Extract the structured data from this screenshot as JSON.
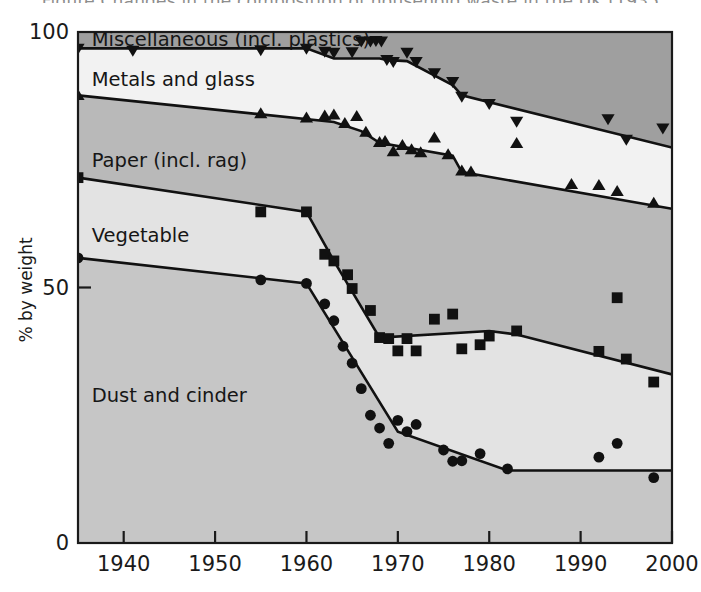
{
  "figure": {
    "clipped_caption_top": "Figure  Changes in the composition of household waste in the UK (1935",
    "background_color": "#ffffff",
    "line_color": "#111111",
    "marker_color": "#111111"
  },
  "axes": {
    "x": {
      "label": "",
      "ticks": [
        "1940",
        "1950",
        "1960",
        "1970",
        "1980",
        "1990",
        "2000"
      ],
      "tick_values": [
        1940,
        1950,
        1960,
        1970,
        1980,
        1990,
        2000
      ],
      "range": [
        1935,
        2000
      ]
    },
    "y": {
      "label": "% by weight",
      "ticks": [
        "0",
        "50",
        "100"
      ],
      "tick_values": [
        0,
        50,
        100
      ],
      "range": [
        0,
        100
      ]
    }
  },
  "bands": [
    {
      "name": "miscellaneous",
      "label": "Miscellaneous (incl. plastics)",
      "fill": "#9f9f9f",
      "label_x": 1936.5,
      "label_y": 97.3
    },
    {
      "name": "metals-and-glass",
      "label": "Metals and glass",
      "fill": "#f2f2f2",
      "label_x": 1936.5,
      "label_y": 89.5
    },
    {
      "name": "paper",
      "label": "Paper (incl. rag)",
      "fill": "#b9b9b9",
      "label_x": 1936.5,
      "label_y": 73.5
    },
    {
      "name": "vegetable",
      "label": "Vegetable",
      "fill": "#e3e3e3",
      "label_x": 1936.5,
      "label_y": 59.0
    },
    {
      "name": "dust-and-cinder",
      "label": "Dust and cinder",
      "fill": "#c6c6c6",
      "label_x": 1936.5,
      "label_y": 27.5
    }
  ],
  "chart_data": {
    "type": "line",
    "title": "",
    "xlabel": "",
    "ylabel": "% by weight",
    "xlim": [
      1935,
      2000
    ],
    "ylim": [
      0,
      100
    ],
    "grid": false,
    "legend": "inline band labels",
    "note": "Cumulative stacked boundary lines; each series is the upper boundary of a cumulative band. Scatter markers are measured survey values on each boundary.",
    "series": [
      {
        "name": "Miscellaneous (incl. plastics)",
        "marker": "triangle-down",
        "boundary_line": {
          "x": [
            1935,
            1960,
            1963,
            1968,
            1969,
            1971,
            1976,
            1977,
            2000
          ],
          "y": [
            96.8,
            96.8,
            94.8,
            94.8,
            94.5,
            94.3,
            89.6,
            87.6,
            77.4
          ]
        },
        "points": {
          "x": [
            1935,
            1941,
            1955,
            1960,
            1962,
            1963,
            1965,
            1966,
            1967,
            1967.6,
            1968.2,
            1968.8,
            1969.5,
            1971,
            1972,
            1974,
            1976,
            1977,
            1980,
            1983,
            1993,
            1995,
            1999
          ],
          "y": [
            96.8,
            96.4,
            96.5,
            96.8,
            96.2,
            96.0,
            96.1,
            98.2,
            98.2,
            98.3,
            98.2,
            94.6,
            94.2,
            96.0,
            94.2,
            92.0,
            90.3,
            87.4,
            86.0,
            82.5,
            83.0,
            79.0,
            81.2
          ]
        }
      },
      {
        "name": "Metals and glass",
        "marker": "triangle-up",
        "boundary_line": {
          "x": [
            1935,
            1963,
            1966,
            1968,
            1976,
            1977,
            2000
          ],
          "y": [
            87.6,
            82.4,
            80.6,
            78.3,
            75.8,
            72.6,
            65.4
          ]
        },
        "points": {
          "x": [
            1935,
            1955,
            1960,
            1962,
            1963,
            1964.2,
            1965.5,
            1966.5,
            1968,
            1968.6,
            1969.5,
            1970.5,
            1971.5,
            1972.5,
            1974,
            1975.5,
            1977,
            1978,
            1983,
            1989,
            1992,
            1994,
            1998
          ],
          "y": [
            87.6,
            84.0,
            83.2,
            83.6,
            83.8,
            82.1,
            83.5,
            80.4,
            78.4,
            78.6,
            76.6,
            77.8,
            77.0,
            76.4,
            79.3,
            76.0,
            72.8,
            72.6,
            78.2,
            70.2,
            70.0,
            68.8,
            66.5
          ]
        }
      },
      {
        "name": "Paper (incl. rag)",
        "marker": "square",
        "boundary_line": {
          "x": [
            1935,
            1960,
            1963,
            1968,
            1980,
            1983,
            2000
          ],
          "y": [
            71.5,
            64.8,
            55.2,
            40.2,
            41.5,
            40.8,
            33.0
          ]
        },
        "points": {
          "x": [
            1935,
            1955,
            1960,
            1962,
            1963,
            1964.5,
            1965,
            1967,
            1968,
            1969,
            1970,
            1971,
            1972,
            1974,
            1976,
            1977,
            1979,
            1980,
            1983,
            1992,
            1994,
            1995,
            1998
          ],
          "y": [
            71.5,
            64.8,
            64.8,
            56.5,
            55.2,
            52.5,
            49.8,
            45.5,
            40.2,
            40.0,
            37.6,
            40.0,
            37.6,
            43.8,
            44.8,
            38.0,
            38.8,
            40.5,
            41.5,
            37.5,
            48.0,
            36.0,
            31.5
          ]
        }
      },
      {
        "name": "Vegetable",
        "marker": "circle",
        "boundary_line": {
          "x": [
            1935,
            1960,
            1970,
            1982,
            2000
          ],
          "y": [
            55.8,
            50.8,
            21.8,
            14.2,
            14.2
          ]
        },
        "points": {
          "x": [
            1935,
            1955,
            1960,
            1962,
            1963,
            1964,
            1965,
            1966,
            1967,
            1968,
            1969,
            1970,
            1971,
            1972,
            1975,
            1976,
            1977,
            1979,
            1982,
            1992,
            1994,
            1998
          ],
          "y": [
            55.8,
            51.5,
            50.8,
            46.8,
            43.5,
            38.5,
            35.2,
            30.2,
            25.0,
            22.5,
            19.5,
            24.0,
            21.8,
            23.2,
            18.2,
            16.0,
            16.1,
            17.5,
            14.5,
            16.8,
            19.5,
            12.8
          ]
        }
      }
    ]
  }
}
